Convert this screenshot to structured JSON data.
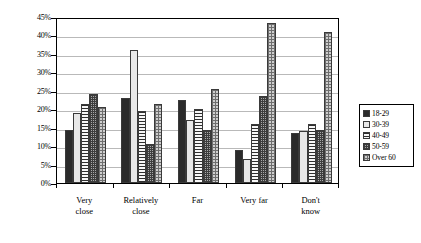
{
  "chart_data": {
    "type": "bar",
    "title": "",
    "xlabel": "",
    "ylabel": "",
    "ylim": [
      0,
      45
    ],
    "ytick_step": 5,
    "grid": true,
    "legend_position": "right",
    "categories": [
      "Very\nclose",
      "Relatively\nclose",
      "Far",
      "Very far",
      "Don't\nknow"
    ],
    "ytick_labels": [
      "0%",
      "5%",
      "10%",
      "15%",
      "20%",
      "25%",
      "30%",
      "35%",
      "40%",
      "45%"
    ],
    "ytick_values": [
      0,
      5,
      10,
      15,
      20,
      25,
      30,
      35,
      40,
      45
    ],
    "series": [
      {
        "name": "18-29",
        "pattern": "solid-dark",
        "color": "#2b2b2b",
        "values": [
          14.5,
          23.0,
          22.5,
          9.0,
          13.5
        ]
      },
      {
        "name": "30-39",
        "pattern": "solid-light",
        "color": "#e8e8e8",
        "values": [
          19.0,
          36.0,
          17.0,
          6.5,
          14.0
        ]
      },
      {
        "name": "40-49",
        "pattern": "horizontal-lines",
        "color": "#f2f2f2",
        "values": [
          21.5,
          19.5,
          20.0,
          16.0,
          16.0
        ]
      },
      {
        "name": "50-59",
        "pattern": "dark-crosshatch",
        "color": "#a8a8a8",
        "values": [
          24.0,
          10.5,
          14.5,
          23.5,
          14.5
        ]
      },
      {
        "name": "Over 60",
        "pattern": "light-crosshatch",
        "color": "#cfcfcf",
        "values": [
          20.5,
          21.5,
          25.5,
          43.5,
          41.0
        ]
      }
    ]
  }
}
